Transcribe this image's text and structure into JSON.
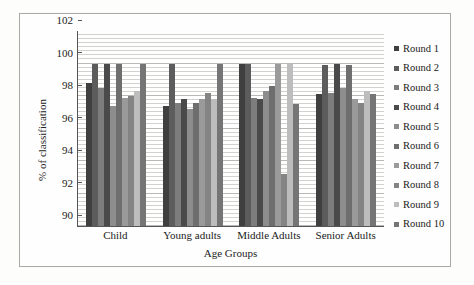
{
  "chart_data": {
    "type": "bar",
    "title": "",
    "xlabel": "Age Groups",
    "ylabel": "% of classification",
    "ylim": [
      90,
      102
    ],
    "ytick_values": [
      102,
      100,
      98,
      96,
      94,
      92,
      90
    ],
    "ytick_labels": [
      "102",
      "100",
      "98",
      "96",
      "94",
      "92",
      "90"
    ],
    "grid": true,
    "grid_axis": "y",
    "minor_grid": true,
    "legend_position": "right",
    "categories": [
      "Child",
      "Young adults",
      "Middle Adults",
      "Senior Adults"
    ],
    "series": [
      {
        "name": "Round 1",
        "color": "#3f3f3f",
        "values": [
          98.8,
          97.4,
          100.0,
          98.1
        ]
      },
      {
        "name": "Round 2",
        "color": "#5c5c5c",
        "values": [
          100.0,
          100.0,
          100.0,
          99.9
        ]
      },
      {
        "name": "Round 3",
        "color": "#7d7d7d",
        "values": [
          98.5,
          97.6,
          97.9,
          98.2
        ]
      },
      {
        "name": "Round 4",
        "color": "#4a4a4a",
        "values": [
          100.0,
          97.8,
          97.8,
          100.0
        ]
      },
      {
        "name": "Round 5",
        "color": "#8d8d8d",
        "values": [
          97.4,
          97.2,
          98.3,
          98.5
        ]
      },
      {
        "name": "Round 6",
        "color": "#6e6e6e",
        "values": [
          100.0,
          97.6,
          98.6,
          99.9
        ]
      },
      {
        "name": "Round 7",
        "color": "#9a9a9a",
        "values": [
          97.9,
          97.8,
          100.0,
          97.8
        ]
      },
      {
        "name": "Round 8",
        "color": "#848484",
        "values": [
          98.0,
          98.2,
          93.2,
          97.6
        ]
      },
      {
        "name": "Round 9",
        "color": "#bdbdbd",
        "values": [
          98.3,
          97.8,
          100.0,
          98.3
        ]
      },
      {
        "name": "Round 10",
        "color": "#757575",
        "values": [
          100.0,
          100.0,
          97.5,
          98.1
        ]
      }
    ]
  },
  "axis": {
    "y_title": "% of classification",
    "x_title": "Age Groups"
  }
}
